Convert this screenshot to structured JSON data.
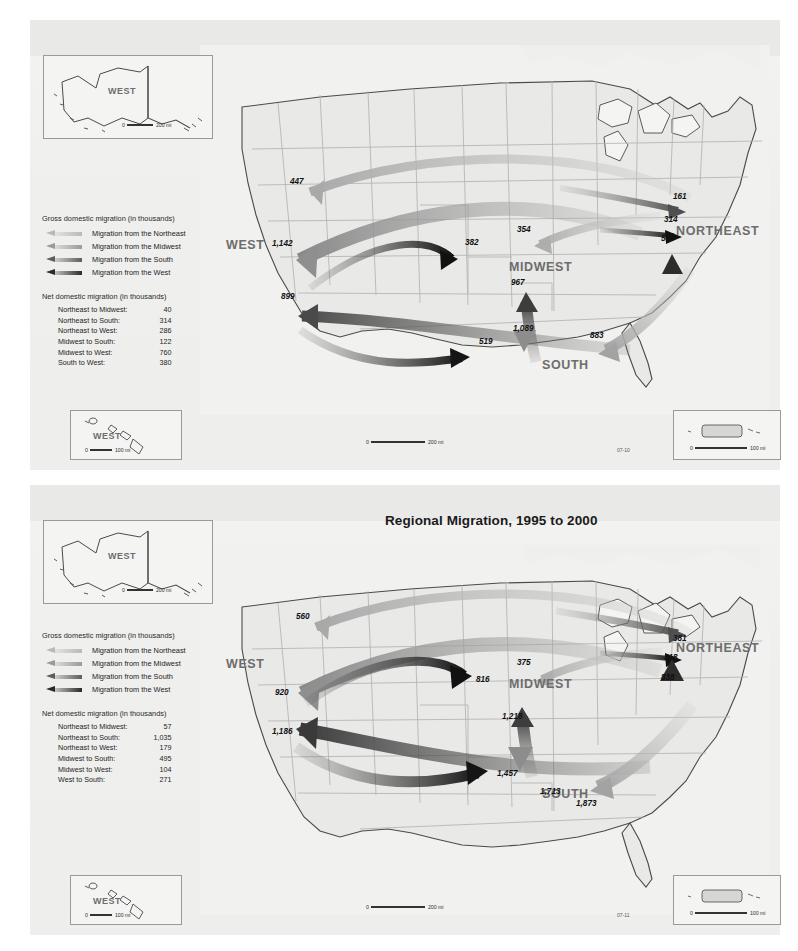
{
  "maps": [
    {
      "id": "map-1955-1960",
      "title": "Regional Migration, 1955 to 1960",
      "regions": {
        "west": "WEST",
        "midwest": "MIDWEST",
        "south": "SOUTH",
        "northeast": "NORTHEAST"
      },
      "legend": {
        "gross_heading": "Gross domestic migration (in thousands)",
        "entries": [
          {
            "label": "Migration from the Northeast",
            "color": "#b9b9b9"
          },
          {
            "label": "Migration from the Midwest",
            "color": "#9a9a9a"
          },
          {
            "label": "Migration from the South",
            "color": "#5d5d5d"
          },
          {
            "label": "Migration from the West",
            "color": "#2a2a2a"
          }
        ],
        "net_heading": "Net domestic migration (in thousands)",
        "net_rows": [
          {
            "label": "Northeast to Midwest:",
            "value": "40"
          },
          {
            "label": "Northeast to South:",
            "value": "314"
          },
          {
            "label": "Northeast to West:",
            "value": "286"
          },
          {
            "label": "Midwest to South:",
            "value": "122"
          },
          {
            "label": "Midwest to West:",
            "value": "760"
          },
          {
            "label": "South to West:",
            "value": "380"
          }
        ]
      },
      "flows": [
        {
          "value": "447",
          "x": 290,
          "y": 177,
          "from": "northeast",
          "to": "west"
        },
        {
          "value": "1,142",
          "x": 272,
          "y": 239,
          "from": "midwest",
          "to": "west"
        },
        {
          "value": "899",
          "x": 281,
          "y": 292,
          "from": "south",
          "to": "west"
        },
        {
          "value": "519",
          "x": 479,
          "y": 337,
          "from": "west",
          "to": "south"
        },
        {
          "value": "382",
          "x": 465,
          "y": 238,
          "from": "west",
          "to": "midwest"
        },
        {
          "value": "354",
          "x": 517,
          "y": 225,
          "from": "northeast",
          "to": "midwest"
        },
        {
          "value": "967",
          "x": 511,
          "y": 278,
          "from": "south",
          "to": "midwest"
        },
        {
          "value": "1,089",
          "x": 513,
          "y": 324,
          "from": "midwest",
          "to": "south"
        },
        {
          "value": "883",
          "x": 590,
          "y": 331,
          "from": "northeast",
          "to": "south"
        },
        {
          "value": "161",
          "x": 673,
          "y": 192,
          "from": "midwest",
          "to": "northeast"
        },
        {
          "value": "314",
          "x": 664,
          "y": 215,
          "from": "west",
          "to": "northeast"
        },
        {
          "value": "569",
          "x": 661,
          "y": 234,
          "from": "south",
          "to": "northeast"
        }
      ],
      "insets": {
        "alaska": {
          "label": "WEST",
          "scale_zero": "0",
          "scale_text": "200 mi"
        },
        "hawaii": {
          "label": "WEST",
          "scale_zero": "0",
          "scale_text": "100 mi"
        },
        "puerto_rico": {
          "scale_zero": "0",
          "scale_text": "100 mi"
        }
      },
      "main_scale": {
        "scale_zero": "0",
        "scale_text": "200 mi"
      },
      "map_code": "07-10"
    },
    {
      "id": "map-1995-2000",
      "title": "Regional Migration, 1995 to 2000",
      "regions": {
        "west": "WEST",
        "midwest": "MIDWEST",
        "south": "SOUTH",
        "northeast": "NORTHEAST"
      },
      "legend": {
        "gross_heading": "Gross domestic migration (in thousands)",
        "entries": [
          {
            "label": "Migration from the Northeast",
            "color": "#b9b9b9"
          },
          {
            "label": "Migration from the Midwest",
            "color": "#9a9a9a"
          },
          {
            "label": "Migration from the South",
            "color": "#5d5d5d"
          },
          {
            "label": "Migration from the West",
            "color": "#2a2a2a"
          }
        ],
        "net_heading": "Net domestic migration (in thousands)",
        "net_rows": [
          {
            "label": "Northeast to Midwest:",
            "value": "57"
          },
          {
            "label": "Northeast to South:",
            "value": "1,035"
          },
          {
            "label": "Northeast to West:",
            "value": "179"
          },
          {
            "label": "Midwest to South:",
            "value": "495"
          },
          {
            "label": "Midwest to West:",
            "value": "104"
          },
          {
            "label": "West to South:",
            "value": "271"
          }
        ]
      },
      "flows": [
        {
          "value": "560",
          "x": 296,
          "y": 612,
          "from": "northeast",
          "to": "west"
        },
        {
          "value": "920",
          "x": 275,
          "y": 688,
          "from": "midwest",
          "to": "west"
        },
        {
          "value": "1,186",
          "x": 272,
          "y": 727,
          "from": "south",
          "to": "west"
        },
        {
          "value": "1,457",
          "x": 497,
          "y": 769,
          "from": "west",
          "to": "south"
        },
        {
          "value": "816",
          "x": 476,
          "y": 675,
          "from": "west",
          "to": "midwest"
        },
        {
          "value": "375",
          "x": 517,
          "y": 658,
          "from": "northeast",
          "to": "midwest"
        },
        {
          "value": "1,218",
          "x": 502,
          "y": 712,
          "from": "south",
          "to": "midwest"
        },
        {
          "value": "1,713",
          "x": 540,
          "y": 787,
          "from": "midwest",
          "to": "south"
        },
        {
          "value": "1,873",
          "x": 576,
          "y": 799,
          "from": "northeast",
          "to": "south"
        },
        {
          "value": "381",
          "x": 673,
          "y": 634,
          "from": "midwest",
          "to": "northeast"
        },
        {
          "value": "318",
          "x": 664,
          "y": 653,
          "from": "west",
          "to": "northeast"
        },
        {
          "value": "838",
          "x": 661,
          "y": 673,
          "from": "south",
          "to": "northeast"
        }
      ],
      "insets": {
        "alaska": {
          "label": "WEST",
          "scale_zero": "0",
          "scale_text": "200 mi"
        },
        "hawaii": {
          "label": "WEST",
          "scale_zero": "0",
          "scale_text": "100 mi"
        },
        "puerto_rico": {
          "scale_zero": "0",
          "scale_text": "100 mi"
        }
      },
      "main_scale": {
        "scale_zero": "0",
        "scale_text": "200 mi"
      },
      "map_code": "07-11"
    }
  ],
  "colors": {
    "from_northeast": "#b9b9b9",
    "from_midwest": "#9a9a9a",
    "from_south": "#5d5d5d",
    "from_west": "#2a2a2a",
    "land": "#e8e8e6",
    "state_border": "#b4b4b2",
    "coast": "#4a4a48",
    "region_text": "#6d6d6d"
  }
}
